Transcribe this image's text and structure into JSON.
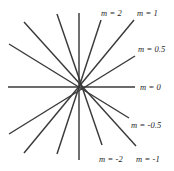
{
  "figure": {
    "type": "pencil-of-lines",
    "background_color": "#ffffff",
    "line_color": "#3a3a3a",
    "label_color": "#262626",
    "center": {
      "x": 79,
      "y": 87
    },
    "width": 174,
    "height": 171
  },
  "chart_data": {
    "type": "line",
    "title": "",
    "subtitle": "",
    "xlabel": "",
    "ylabel": "",
    "grid": false,
    "legend_position": "inline-right",
    "common_point": {
      "x": 79,
      "y": 87
    },
    "annotations": [
      {
        "label": "m = 2",
        "slope": 2,
        "x": 101,
        "y": 9
      },
      {
        "label": "m = 1",
        "slope": 1,
        "x": 137,
        "y": 9
      },
      {
        "label": "m = 0.5",
        "slope": 0.5,
        "x": 138,
        "y": 45
      },
      {
        "label": "m = 0",
        "slope": 0,
        "x": 140,
        "y": 83
      },
      {
        "label": "m = -0.5",
        "slope": -0.5,
        "x": 131,
        "y": 121
      },
      {
        "label": "m = -2",
        "slope": -2,
        "x": 99,
        "y": 155
      },
      {
        "label": "m = -1",
        "slope": -1,
        "x": 136,
        "y": 155
      }
    ],
    "lines": [
      {
        "name": "m = 2",
        "slope": 2,
        "x1": 101,
        "y1": 20,
        "x2": 57,
        "y2": 154
      },
      {
        "name": "m = 1",
        "slope": 1,
        "x1": 134,
        "y1": 20,
        "x2": 24,
        "y2": 153
      },
      {
        "name": "m = 0.5",
        "slope": 0.5,
        "x1": 135,
        "y1": 56,
        "x2": 9,
        "y2": 134
      },
      {
        "name": "m = 0",
        "slope": 0,
        "x1": 135,
        "y1": 87,
        "x2": 8,
        "y2": 87
      },
      {
        "name": "m = -0.5",
        "slope": -0.5,
        "x1": 129,
        "y1": 118,
        "x2": 9,
        "y2": 44
      },
      {
        "name": "m = -1",
        "slope": -1,
        "x1": 136,
        "y1": 146,
        "x2": 24,
        "y2": 22
      },
      {
        "name": "m = -2",
        "slope": -2,
        "x1": 102,
        "y1": 145,
        "x2": 57,
        "y2": 14
      },
      {
        "name": "vertical",
        "slope": null,
        "x1": 79,
        "y1": 13,
        "x2": 79,
        "y2": 160
      }
    ]
  },
  "labels": {
    "m_2": "m = 2",
    "m_1": "m = 1",
    "m_0_5": "m = 0.5",
    "m_0": "m = 0",
    "m_neg_0_5": "m = -0.5",
    "m_neg_2": "m = -2",
    "m_neg_1": "m = -1"
  }
}
